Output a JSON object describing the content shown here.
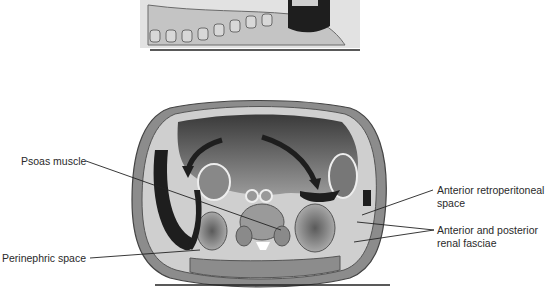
{
  "figure": {
    "top_panel": {
      "description": "Sagittal section of lumbar spine and retroperitoneum"
    },
    "bottom_panel": {
      "description": "Axial cross-section of abdomen with arrows showing fluid spread"
    }
  },
  "labels": {
    "psoas_muscle": "Psoas muscle",
    "perinephric_space": "Perinephric space",
    "anterior_retroperitoneal_line1": "Anterior retroperitoneal",
    "anterior_retroperitoneal_line2": "space",
    "renal_fasciae_line1": "Anterior and posterior",
    "renal_fasciae_line2": "renal fasciae"
  },
  "colors": {
    "dark": "#1e1e1e",
    "mid": "#7a7a7a",
    "light": "#cfcfcf",
    "muscle": "#8c8c8c"
  }
}
